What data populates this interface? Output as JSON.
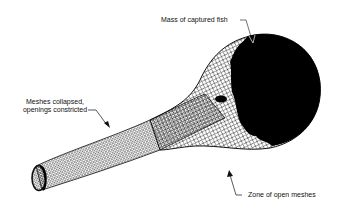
{
  "diagram": {
    "labels": {
      "mass_of_fish": "Mass of captured fish",
      "meshes_collapsed_line1": "Meshes collapsed,",
      "meshes_collapsed_line2": "openings constricted",
      "open_meshes": "Zone of open meshes"
    },
    "colors": {
      "ink": "#111111",
      "background": "#ffffff",
      "catch_mass": "#000000"
    }
  }
}
